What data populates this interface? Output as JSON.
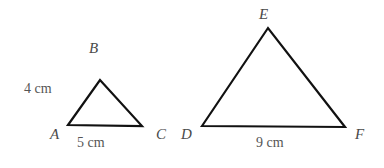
{
  "figure": {
    "background_color": "#ffffff",
    "stroke_color": "#111111",
    "label_color": "#4a4a4a",
    "measure_color": "#555555",
    "stroke_width": 2.2,
    "triangles": [
      {
        "name": "triangle-abc",
        "vertices": [
          {
            "label": "A",
            "x": 68,
            "y": 125
          },
          {
            "label": "B",
            "x": 100,
            "y": 80
          },
          {
            "label": "C",
            "x": 142,
            "y": 126
          }
        ],
        "side_labels": [
          {
            "name": "side-ab-length",
            "text": "4 cm"
          },
          {
            "name": "side-ac-length",
            "text": "5 cm"
          }
        ]
      },
      {
        "name": "triangle-def",
        "vertices": [
          {
            "label": "D",
            "x": 202,
            "y": 126
          },
          {
            "label": "E",
            "x": 268,
            "y": 28
          },
          {
            "label": "F",
            "x": 345,
            "y": 127
          }
        ],
        "side_labels": [
          {
            "name": "side-df-length",
            "text": "9 cm"
          }
        ]
      }
    ],
    "vertex_labels": {
      "A": "A",
      "B": "B",
      "C": "C",
      "D": "D",
      "E": "E",
      "F": "F"
    },
    "measures": {
      "four_cm": "4 cm",
      "five_cm": "5 cm",
      "nine_cm": "9 cm"
    }
  }
}
